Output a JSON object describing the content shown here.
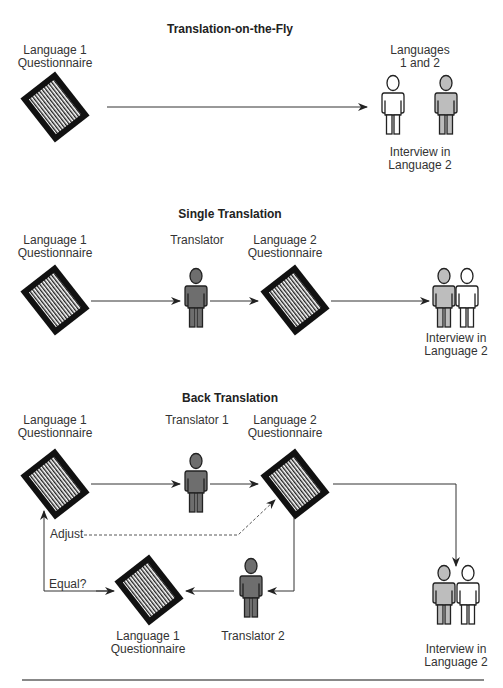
{
  "sections": [
    {
      "title": "Translation-on-the-Fly",
      "labels": {
        "source": [
          "Language 1",
          "Questionnaire"
        ],
        "respondents_top": [
          "Languages",
          "1 and 2"
        ],
        "interview": [
          "Interview in",
          "Language 2"
        ]
      }
    },
    {
      "title": "Single Translation",
      "labels": {
        "source": [
          "Language 1",
          "Questionnaire"
        ],
        "translator": "Translator",
        "target": [
          "Language 2",
          "Questionnaire"
        ],
        "interview": [
          "Interview in",
          "Language 2"
        ]
      }
    },
    {
      "title": "Back Translation",
      "labels": {
        "source": [
          "Language 1",
          "Questionnaire"
        ],
        "translator1": "Translator 1",
        "target": [
          "Language 2",
          "Questionnaire"
        ],
        "adjust": "Adjust",
        "equal": "Equal?",
        "back": [
          "Language 1",
          "Questionnaire"
        ],
        "translator2": "Translator 2",
        "interview": [
          "Interview in",
          "Language 2"
        ]
      }
    }
  ],
  "icons": {
    "questionnaire": "document-icon",
    "translator": "translator-person-icon",
    "respondent_white": "person-outline-icon",
    "respondent_gray": "person-gray-icon"
  },
  "colors": {
    "line": "#333333",
    "doc_border": "#111111",
    "translator_fill": "#6e6e6e",
    "respondent_gray_fill": "#bdbdbd",
    "respondent_white_fill": "#ffffff",
    "footer_rule": "#888888"
  }
}
